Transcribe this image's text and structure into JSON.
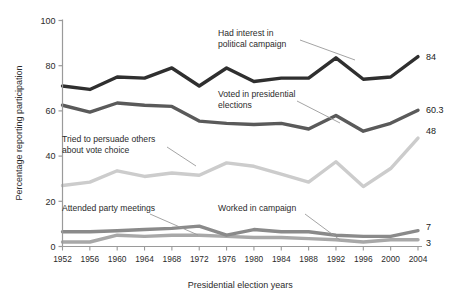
{
  "chart_data": {
    "type": "line",
    "title": "",
    "xlabel": "Presidential election years",
    "ylabel": "Percentage reporting participation",
    "categories": [
      "1952",
      "1956",
      "1960",
      "1964",
      "1968",
      "1972",
      "1976",
      "1980",
      "1984",
      "1988",
      "1992",
      "1996",
      "2000",
      "2004"
    ],
    "xlim": [
      1952,
      2004
    ],
    "ylim": [
      0,
      100
    ],
    "yticks": [
      0,
      20,
      40,
      60,
      80,
      100
    ],
    "grid": false,
    "legend": "inline-annotations",
    "series": [
      {
        "name": "Had interest in political campaign",
        "color": "#2f2f2f",
        "end_label": "84",
        "values": [
          71,
          69.5,
          75,
          74.5,
          79,
          71,
          79,
          73,
          74.5,
          74.5,
          83.5,
          74,
          75,
          84
        ]
      },
      {
        "name": "Voted in presidential elections",
        "color": "#5a5a5a",
        "end_label": "60.3",
        "values": [
          62.5,
          59.5,
          63.5,
          62.5,
          62,
          55.5,
          54.5,
          54,
          54.5,
          52,
          58,
          51,
          54.5,
          60.3
        ]
      },
      {
        "name": "Tried to persuade others about vote choice",
        "color": "#cccccc",
        "end_label": "48",
        "values": [
          27,
          28.5,
          33.5,
          31,
          32.5,
          31.5,
          37,
          35.5,
          32,
          28.5,
          37.5,
          26.5,
          34.5,
          48
        ]
      },
      {
        "name": "Attended party meetings",
        "color": "#8a8a8a",
        "end_label": "7",
        "values": [
          6.5,
          6.5,
          7,
          7.5,
          8,
          9,
          5,
          7.5,
          6.5,
          6.5,
          5,
          4.5,
          4.5,
          7
        ]
      },
      {
        "name": "Worked in campaign",
        "color": "#a8a8a8",
        "end_label": "3",
        "values": [
          2,
          2,
          5,
          4.5,
          5,
          5,
          4.5,
          4,
          4,
          3.5,
          3,
          2,
          3,
          3
        ]
      }
    ],
    "annotations": [
      {
        "name": "had-interest",
        "lines": [
          "Had interest in",
          "political campaign"
        ],
        "x": 218,
        "y": 36
      },
      {
        "name": "voted",
        "lines": [
          "Voted in presidential",
          "elections"
        ],
        "x": 218,
        "y": 97
      },
      {
        "name": "persuade",
        "lines": [
          "Tried to persuade others",
          "about vote choice"
        ],
        "x": 62,
        "y": 142
      },
      {
        "name": "attended",
        "lines": [
          "Attended party meetings"
        ],
        "x": 62,
        "y": 211
      },
      {
        "name": "worked",
        "lines": [
          "Worked in campaign"
        ],
        "x": 218,
        "y": 211
      }
    ]
  }
}
